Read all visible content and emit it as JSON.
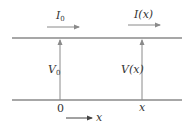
{
  "diagram": {
    "type": "transmission-line",
    "colors": {
      "line": "#8a8a8a",
      "text": "#333333",
      "background": "#ffffff"
    },
    "labels": {
      "current_start": {
        "main": "I",
        "sub": "0"
      },
      "current_x": "I(x)",
      "voltage_start": {
        "main": "V",
        "sub": "0"
      },
      "voltage_x": "V(x)",
      "position_zero": "0",
      "position_x": "x",
      "axis_label": "x"
    }
  }
}
